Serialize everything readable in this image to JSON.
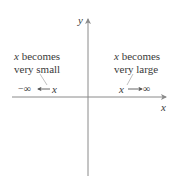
{
  "diagram": {
    "axes": {
      "x_label": "x",
      "y_label": "y"
    },
    "left_annotation": {
      "line1_var": "x",
      "line1_rest": " becomes",
      "line2": "very small",
      "expression_left": "−∞",
      "expression_var": "x"
    },
    "right_annotation": {
      "line1_var": "x",
      "line1_rest": " becomes",
      "line2": "very large",
      "expression_var": "x",
      "expression_right": "∞"
    },
    "colors": {
      "axis": "#8a8a8a",
      "text": "#3a3a3a",
      "leader": "#b0b0b0"
    }
  }
}
